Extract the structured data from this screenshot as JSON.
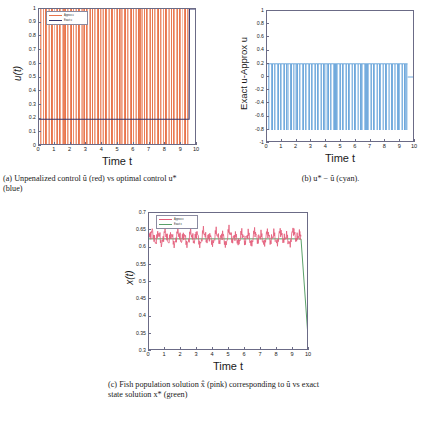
{
  "figure": {
    "colors": {
      "approx_u_red": "#e8734a",
      "exact_u_blue": "#35356b",
      "diff_cyan": "#6ea8dc",
      "approx_x_pink": "#e35d7a",
      "exact_x_green": "#5aa06a",
      "axis": "#6b6b86",
      "text": "#1a1a1a"
    }
  },
  "panel_a": {
    "name": "unpenalized-control-plot",
    "ylabel": "u(t)",
    "xlabel": "Time t",
    "yticks": [
      "0",
      "0.1",
      "0.2",
      "0.3",
      "0.4",
      "0.5",
      "0.6",
      "0.7",
      "0.8",
      "0.9",
      "1"
    ],
    "xticks": [
      "0",
      "1",
      "2",
      "3",
      "4",
      "5",
      "6",
      "7",
      "8",
      "9",
      "10"
    ],
    "ylim": [
      0,
      1
    ],
    "xlim": [
      0,
      10
    ],
    "legend": [
      {
        "label": "Approx u",
        "color": "#e8734a"
      },
      {
        "label": "Exact u",
        "color": "#35356b"
      }
    ],
    "caption": "(a) Unpenalized control û (red) vs optimal control u* (blue)"
  },
  "panel_b": {
    "name": "control-difference-plot",
    "ylabel": "Exact u-Approx u",
    "xlabel": "Time t",
    "yticks": [
      "-1",
      "-0.8",
      "-0.6",
      "-0.4",
      "-0.2",
      "0",
      "0.2",
      "0.4",
      "0.6",
      "0.8",
      "1"
    ],
    "xticks": [
      "0",
      "1",
      "2",
      "3",
      "4",
      "5",
      "6",
      "7",
      "8",
      "9",
      "10"
    ],
    "ylim": [
      -1,
      1
    ],
    "xlim": [
      0,
      10
    ],
    "caption": "(b) u* − û (cyan)."
  },
  "panel_c": {
    "name": "fish-population-plot",
    "ylabel": "x(t)",
    "xlabel": "Time t",
    "yticks": [
      "0.3",
      "0.35",
      "0.4",
      "0.45",
      "0.5",
      "0.55",
      "0.6",
      "0.65",
      "0.7"
    ],
    "xticks": [
      "0",
      "1",
      "2",
      "3",
      "4",
      "5",
      "6",
      "7",
      "8",
      "9",
      "10"
    ],
    "ylim": [
      0.3,
      0.7
    ],
    "xlim": [
      0,
      10
    ],
    "legend": [
      {
        "label": "Approx x",
        "color": "#e35d7a"
      },
      {
        "label": "Exact x",
        "color": "#5aa06a"
      }
    ],
    "caption": "(c) Fish population solution x̂ (pink) corresponding to û vs exact state solution x* (green)"
  },
  "chart_data": [
    {
      "type": "bar",
      "id": "panel_a",
      "title": "",
      "xlabel": "Time t",
      "ylabel": "u(t)",
      "xlim": [
        0,
        10
      ],
      "ylim": [
        0,
        1
      ],
      "grid": false,
      "legend_position": "top-left",
      "series": [
        {
          "name": "Approx u",
          "color": "#e8734a",
          "note": "bang-bang / chattering control: ~95 near-vertical excursions between 0 and 1 over t in [0,9.5], zero after t=9.5",
          "x": [
            0.05,
            0.15,
            0.25,
            0.35,
            0.45,
            0.55,
            0.65,
            0.75,
            0.85,
            0.95,
            1.05,
            1.15,
            1.25,
            1.35,
            1.45,
            1.55,
            1.65,
            1.75,
            1.85,
            1.95,
            2.05,
            2.15,
            2.25,
            2.35,
            2.45,
            2.55,
            2.65,
            2.75,
            2.85,
            2.95,
            3.05,
            3.15,
            3.25,
            3.35,
            3.45,
            3.55,
            3.65,
            3.75,
            3.85,
            3.95,
            4.05,
            4.15,
            4.25,
            4.35,
            4.45,
            4.55,
            4.65,
            4.75,
            4.85,
            4.95,
            5.05,
            5.15,
            5.25,
            5.35,
            5.45,
            5.55,
            5.65,
            5.75,
            5.85,
            5.95,
            6.05,
            6.15,
            6.25,
            6.35,
            6.45,
            6.55,
            6.65,
            6.75,
            6.85,
            6.95,
            7.05,
            7.15,
            7.25,
            7.35,
            7.45,
            7.55,
            7.65,
            7.75,
            7.85,
            7.95,
            8.05,
            8.15,
            8.25,
            8.35,
            8.45,
            8.55,
            8.65,
            8.75,
            8.85,
            8.95,
            9.05,
            9.15,
            9.25,
            9.35,
            9.45
          ],
          "values": [
            1,
            1,
            1,
            1,
            1,
            1,
            1,
            1,
            1,
            1,
            1,
            1,
            1,
            1,
            1,
            1,
            1,
            1,
            1,
            1,
            1,
            1,
            1,
            1,
            1,
            1,
            1,
            1,
            1,
            1,
            1,
            1,
            1,
            1,
            1,
            1,
            1,
            1,
            1,
            1,
            1,
            1,
            1,
            1,
            1,
            1,
            1,
            1,
            1,
            1,
            1,
            1,
            1,
            1,
            1,
            1,
            1,
            1,
            1,
            1,
            1,
            1,
            1,
            1,
            1,
            1,
            1,
            1,
            1,
            1,
            1,
            1,
            1,
            1,
            1,
            1,
            1,
            1,
            1,
            1,
            1,
            1,
            1,
            1,
            1,
            1,
            1,
            1,
            1,
            1,
            1,
            1,
            1,
            1,
            1
          ]
        },
        {
          "name": "Exact u",
          "color": "#35356b",
          "note": "constant singular control at 0.195 for t in [0,9.5] then jumps to 1",
          "x": [
            0,
            9.5,
            9.52,
            10
          ],
          "values": [
            0.195,
            0.195,
            1.0,
            1.0
          ]
        }
      ]
    },
    {
      "type": "bar",
      "id": "panel_b",
      "title": "",
      "xlabel": "Time t",
      "ylabel": "Exact u-Approx u",
      "xlim": [
        0,
        10
      ],
      "ylim": [
        -1,
        1
      ],
      "grid": false,
      "legend_position": "none",
      "series": [
        {
          "name": "u* - û",
          "color": "#6ea8dc",
          "note": "difference oscillates between +0.2 (when û=0) and -0.8 (when û=1); equals 0.2 flat region near t=9.5-10",
          "upper_envelope": 0.2,
          "lower_envelope": -0.8,
          "x": [
            0.05,
            0.15,
            0.25,
            0.35,
            0.45,
            0.55,
            0.65,
            0.75,
            0.85,
            0.95,
            1.05,
            1.15,
            1.25,
            1.35,
            1.45,
            1.55,
            1.65,
            1.75,
            1.85,
            1.95,
            2.05,
            2.15,
            2.25,
            2.35,
            2.45,
            2.55,
            2.65,
            2.75,
            2.85,
            2.95,
            3.05,
            3.15,
            3.25,
            3.35,
            3.45,
            3.55,
            3.65,
            3.75,
            3.85,
            3.95,
            4.05,
            4.15,
            4.25,
            4.35,
            4.45,
            4.55,
            4.65,
            4.75,
            4.85,
            4.95,
            5.05,
            5.15,
            5.25,
            5.35,
            5.45,
            5.55,
            5.65,
            5.75,
            5.85,
            5.95,
            6.05,
            6.15,
            6.25,
            6.35,
            6.45,
            6.55,
            6.65,
            6.75,
            6.85,
            6.95,
            7.05,
            7.15,
            7.25,
            7.35,
            7.45,
            7.55,
            7.65,
            7.75,
            7.85,
            7.95,
            8.05,
            8.15,
            8.25,
            8.35,
            8.45,
            8.55,
            8.65,
            8.75,
            8.85,
            8.95,
            9.05,
            9.15,
            9.25,
            9.35,
            9.45
          ],
          "values": [
            -0.8,
            -0.8,
            -0.8,
            -0.8,
            -0.8,
            -0.8,
            -0.8,
            -0.8,
            -0.8,
            -0.8,
            -0.8,
            -0.8,
            -0.8,
            -0.8,
            -0.8,
            -0.8,
            -0.8,
            -0.8,
            -0.8,
            -0.8,
            -0.8,
            -0.8,
            -0.8,
            -0.8,
            -0.8,
            -0.8,
            -0.8,
            -0.8,
            -0.8,
            -0.8,
            -0.8,
            -0.8,
            -0.8,
            -0.8,
            -0.8,
            -0.8,
            -0.8,
            -0.8,
            -0.8,
            -0.8,
            -0.8,
            -0.8,
            -0.8,
            -0.8,
            -0.8,
            -0.8,
            -0.8,
            -0.8,
            -0.8,
            -0.8,
            -0.8,
            -0.8,
            -0.8,
            -0.8,
            -0.8,
            -0.8,
            -0.8,
            -0.8,
            -0.8,
            -0.8,
            -0.8,
            -0.8,
            -0.8,
            -0.8,
            -0.8,
            -0.8,
            -0.8,
            -0.8,
            -0.8,
            -0.8,
            -0.8,
            -0.8,
            -0.8,
            -0.8,
            -0.8,
            -0.8,
            -0.8,
            -0.8,
            -0.8,
            -0.8,
            -0.8,
            -0.8,
            -0.8,
            -0.8,
            -0.8,
            -0.8,
            -0.8,
            -0.8,
            -0.8,
            -0.8,
            -0.8,
            -0.8,
            -0.8,
            -0.8,
            -0.8
          ]
        }
      ]
    },
    {
      "type": "line",
      "id": "panel_c",
      "title": "",
      "xlabel": "Time t",
      "ylabel": "x(t)",
      "xlim": [
        0,
        10
      ],
      "ylim": [
        0.3,
        0.7
      ],
      "grid": false,
      "legend_position": "top-left",
      "series": [
        {
          "name": "Approx x",
          "color": "#e35d7a",
          "note": "rapidly oscillating state, mean ~0.625, oscillation band 0.600-0.660, ends near 0.632 at t=9.5",
          "mean": 0.625,
          "band": [
            0.6,
            0.662
          ],
          "x": [
            0.0,
            0.2,
            0.4,
            0.6,
            0.8,
            1.0,
            1.2,
            1.4,
            1.6,
            1.8,
            2.0,
            2.2,
            2.4,
            2.6,
            2.8,
            3.0,
            3.2,
            3.4,
            3.6,
            3.8,
            4.0,
            4.2,
            4.4,
            4.6,
            4.8,
            5.0,
            5.2,
            5.4,
            5.6,
            5.8,
            6.0,
            6.2,
            6.4,
            6.6,
            6.8,
            7.0,
            7.2,
            7.4,
            7.6,
            7.8,
            8.0,
            8.2,
            8.4,
            8.6,
            8.8,
            9.0,
            9.2,
            9.4,
            9.5
          ],
          "values": [
            0.628,
            0.648,
            0.612,
            0.645,
            0.607,
            0.652,
            0.614,
            0.64,
            0.605,
            0.65,
            0.618,
            0.638,
            0.606,
            0.647,
            0.616,
            0.644,
            0.604,
            0.651,
            0.62,
            0.636,
            0.608,
            0.649,
            0.617,
            0.641,
            0.603,
            0.655,
            0.621,
            0.637,
            0.61,
            0.646,
            0.615,
            0.643,
            0.605,
            0.65,
            0.619,
            0.639,
            0.607,
            0.648,
            0.616,
            0.642,
            0.609,
            0.651,
            0.62,
            0.635,
            0.606,
            0.654,
            0.622,
            0.64,
            0.632
          ]
        },
        {
          "name": "Exact x",
          "color": "#5aa06a",
          "note": "flat at ~0.625 until t=9.5 then drops steeply to ~0.30 at t=10",
          "x": [
            0,
            9.5,
            10
          ],
          "values": [
            0.625,
            0.625,
            0.3
          ]
        }
      ]
    }
  ]
}
